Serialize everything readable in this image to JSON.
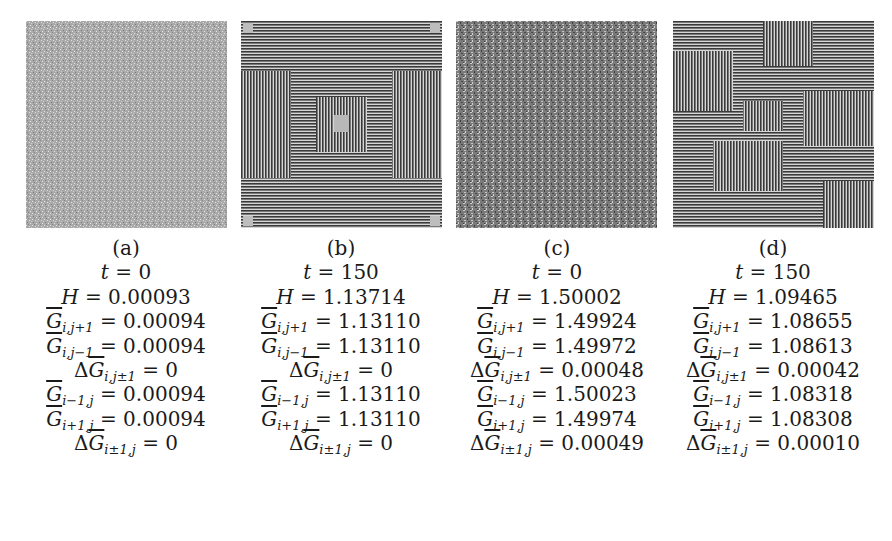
{
  "figure": {
    "panels": [
      {
        "label": "(a)",
        "pattern": "random-noise-light",
        "t": "0",
        "H": "0.00093",
        "G_i_jplus1": "0.00094",
        "G_i_jminus1": "0.00094",
        "dG_i_jpm1": "0",
        "G_iminus1_j": "0.00094",
        "G_iplus1_j": "0.00094",
        "dG_ipm1_j": "0"
      },
      {
        "label": "(b)",
        "pattern": "symmetric-maze",
        "t": "150",
        "H": "1.13714",
        "G_i_jplus1": "1.13110",
        "G_i_jminus1": "1.13110",
        "dG_i_jpm1": "0",
        "G_iminus1_j": "1.13110",
        "G_iplus1_j": "1.13110",
        "dG_ipm1_j": "0"
      },
      {
        "label": "(c)",
        "pattern": "random-noise-dark",
        "t": "0",
        "H": "1.50002",
        "G_i_jplus1": "1.49924",
        "G_i_jminus1": "1.49972",
        "dG_i_jpm1": "0.00048",
        "G_iminus1_j": "1.50023",
        "G_iplus1_j": "1.49974",
        "dG_ipm1_j": "0.00049"
      },
      {
        "label": "(d)",
        "pattern": "asymmetric-maze",
        "t": "150",
        "H": "1.09465",
        "G_i_jplus1": "1.08655",
        "G_i_jminus1": "1.08613",
        "dG_i_jpm1": "0.00042",
        "G_iminus1_j": "1.08318",
        "G_iplus1_j": "1.08308",
        "dG_ipm1_j": "0.00010"
      }
    ],
    "symbols": {
      "t": "t",
      "H": "H",
      "G": "G",
      "delta": "Δ",
      "eq": " = ",
      "sub_i_jplus1": "i,j+1",
      "sub_i_jminus1": "i,j−1",
      "sub_i_jpm1": "i,j±1",
      "sub_iminus1_j": "i−1,j",
      "sub_iplus1_j": "i+1,j",
      "sub_ipm1_j": "i±1,j"
    },
    "colors": {
      "background": "#ffffff",
      "text": "#1a1a1a",
      "pattern_dark": "#3a3a3a",
      "pattern_light": "#d8d8d8"
    }
  }
}
